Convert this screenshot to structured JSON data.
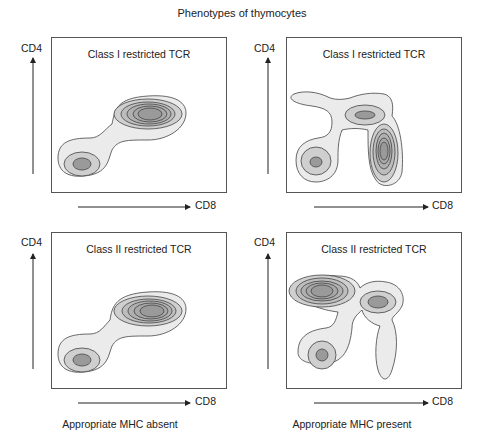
{
  "title": "Phenotypes of thymocytes",
  "panels": [
    {
      "title": "Class I restricted TCR",
      "y_axis": "CD4",
      "x_axis": "CD8"
    },
    {
      "title": "Class I restricted TCR",
      "y_axis": "CD4",
      "x_axis": "CD8"
    },
    {
      "title": "Class II restricted TCR",
      "y_axis": "CD4",
      "x_axis": "CD8"
    },
    {
      "title": "Class II restricted TCR",
      "y_axis": "CD4",
      "x_axis": "CD8"
    }
  ],
  "columns": [
    "Appropriate MHC absent",
    "Appropriate MHC present"
  ],
  "colors": {
    "outer": "#ebebeb",
    "mid": "#cfcfcf",
    "core": "#9a9a9a",
    "line": "#444444"
  }
}
